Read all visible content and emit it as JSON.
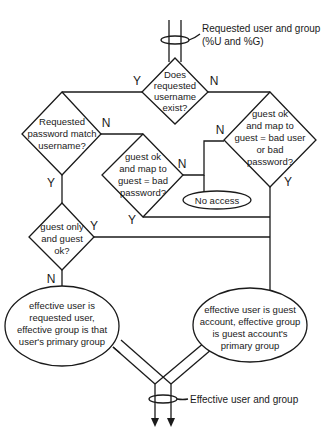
{
  "annotations": {
    "input": {
      "line1": "Requested user and group",
      "line2": "(%U and %G)"
    },
    "output": {
      "line1": "Effective user and group"
    }
  },
  "nodes": {
    "username_exists": {
      "type": "decision",
      "lines": [
        "Does",
        "requested",
        "username",
        "exist?"
      ]
    },
    "password_match": {
      "type": "decision",
      "lines": [
        "Requested",
        "password match",
        "username?"
      ]
    },
    "bad_password": {
      "type": "decision",
      "lines": [
        "guest ok",
        "and map to",
        "guest = bad",
        "password?"
      ]
    },
    "bad_user_or_password": {
      "type": "decision",
      "lines": [
        "guest ok",
        "and map to",
        "guest = bad user",
        "or bad",
        "password?"
      ]
    },
    "guest_only": {
      "type": "decision",
      "lines": [
        "guest only",
        "and guest",
        "ok?"
      ]
    },
    "no_access": {
      "type": "terminal",
      "lines": [
        "No access"
      ]
    },
    "result_requested": {
      "type": "terminal",
      "lines": [
        "effective user is",
        "requested user,",
        "effective group is that",
        "user's primary group"
      ]
    },
    "result_guest": {
      "type": "terminal",
      "lines": [
        "effective user is guest",
        "account, effective group",
        "is guest account's",
        "primary group"
      ]
    }
  },
  "edge_labels": {
    "exists_yes": "Y",
    "exists_no": "N",
    "pwmatch_no": "N",
    "pwmatch_yes": "Y",
    "badpw_no": "N",
    "badpw_yes": "Y",
    "baduser_no": "N",
    "baduser_yes": "Y",
    "guestonly_yes": "Y",
    "guestonly_no": "N"
  },
  "colors": {
    "stroke": "#1a1a1a",
    "background": "#ffffff"
  }
}
